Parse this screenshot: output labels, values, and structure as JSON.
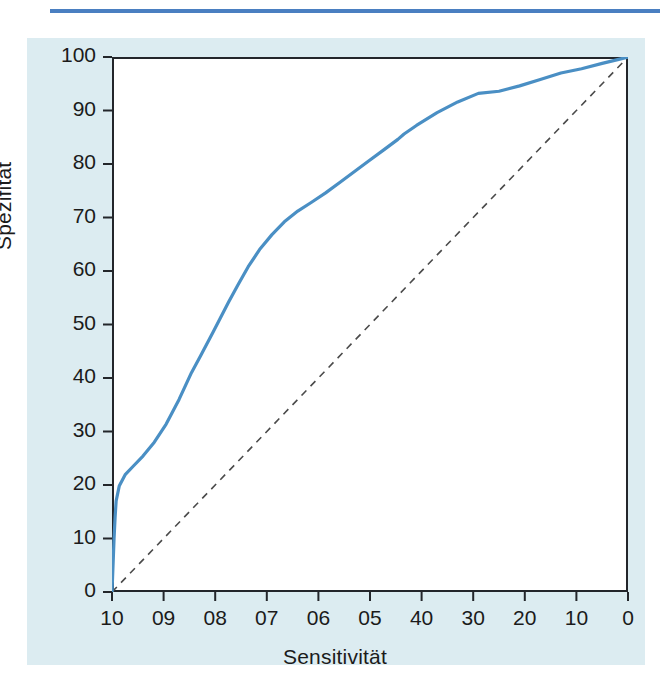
{
  "figure": {
    "panel_background": "#dcecf1",
    "rule_color": "#4a7fc1",
    "curve_color": "#4a8fc4",
    "axis_color": "#23262b",
    "reference_color": "#4a4a4a"
  },
  "chart_data": {
    "type": "line",
    "title": "",
    "subtitle": "",
    "xlabel": "Sensitivität",
    "ylabel": "Spezifität",
    "xlim": [
      100,
      0
    ],
    "ylim": [
      0,
      100
    ],
    "grid": false,
    "legend": "none",
    "x_tick_values": [
      100,
      90,
      80,
      70,
      60,
      50,
      40,
      30,
      20,
      10,
      0
    ],
    "x_tick_labels": [
      "10",
      "09",
      "08",
      "07",
      "06",
      "05",
      "40",
      "30",
      "20",
      "10",
      "0"
    ],
    "y_tick_values": [
      0,
      10,
      20,
      30,
      40,
      50,
      60,
      70,
      80,
      90,
      100
    ],
    "y_tick_labels": [
      "0",
      "10",
      "20",
      "30",
      "40",
      "50",
      "60",
      "70",
      "80",
      "90",
      "100"
    ],
    "series": [
      {
        "name": "ROC curve",
        "style": "solid",
        "color": "#4a8fc4",
        "x": [
          100.0,
          99.8,
          99.6,
          99.4,
          99.2,
          98.6,
          97.4,
          95.8,
          94.0,
          91.8,
          89.5,
          87.0,
          84.6,
          82.8,
          81.6,
          80.4,
          79.0,
          77.4,
          75.6,
          73.6,
          71.4,
          69.0,
          66.6,
          64.0,
          61.4,
          58.6,
          55.8,
          53.0,
          50.2,
          47.4,
          44.6,
          43.4,
          41.0,
          37.0,
          33.0,
          29.0,
          25.0,
          21.0,
          17.0,
          13.0,
          9.0,
          5.0,
          2.0,
          0.0
        ],
        "y": [
          0.0,
          5.0,
          10.0,
          14.0,
          17.0,
          19.8,
          22.0,
          23.6,
          25.4,
          28.0,
          31.4,
          36.0,
          41.0,
          44.2,
          46.4,
          48.6,
          51.2,
          54.2,
          57.4,
          60.8,
          64.0,
          66.8,
          69.2,
          71.2,
          72.8,
          74.6,
          76.6,
          78.6,
          80.6,
          82.6,
          84.6,
          85.6,
          87.2,
          89.6,
          91.6,
          93.2,
          93.6,
          94.6,
          95.8,
          97.0,
          97.8,
          98.8,
          99.5,
          100.0
        ]
      },
      {
        "name": "Reference diagonal",
        "style": "dashed",
        "color": "#4a4a4a",
        "x": [
          100.0,
          0.0
        ],
        "y": [
          0.0,
          100.0
        ]
      }
    ]
  }
}
